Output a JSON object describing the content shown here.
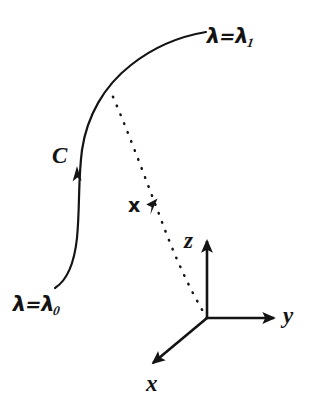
{
  "figure": {
    "background_color": "#ffffff",
    "ink_color": "#141414",
    "labels": {
      "lambda_end": {
        "symbol": "λ",
        "equals": "=",
        "value_symbol": "λ",
        "subscript": "1"
      },
      "lambda_start": {
        "symbol": "λ",
        "equals": "=",
        "value_symbol": "λ",
        "subscript": "0"
      },
      "curve_name": "C",
      "position_vector": "x",
      "axis_z": "z",
      "axis_y": "y",
      "axis_x": "x"
    },
    "elements": {
      "curve": {
        "name": "curve-C",
        "style": "solid",
        "stroke_width": 2.2,
        "start_point": [
          55,
          288
        ],
        "end_point": [
          206,
          32
        ],
        "direction_arrow_at": [
          76,
          168
        ]
      },
      "vector": {
        "name": "position-vector-x",
        "style": "dotted",
        "stroke_width": 2.4,
        "from_point": [
          207,
          318
        ],
        "to_point": [
          110,
          90
        ],
        "arrow_at": [
          150,
          200
        ]
      },
      "axes": {
        "origin": [
          207,
          318
        ],
        "z_tip": [
          207,
          238
        ],
        "y_tip": [
          277,
          318
        ],
        "x_tip": [
          150,
          366
        ],
        "stroke_width": 2.4
      }
    }
  }
}
